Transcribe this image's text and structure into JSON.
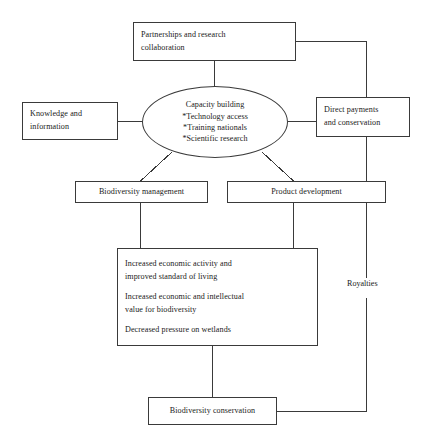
{
  "diagram": {
    "canvas": {
      "width": 432,
      "height": 447
    },
    "style": {
      "stroke_color": "#3a3a3a",
      "text_color": "#1a1a1a",
      "background": "#ffffff"
    },
    "nodes": {
      "partnerships": {
        "shape": "rectangle",
        "line1": "Partnerships and research",
        "line2": "collaboration"
      },
      "knowledge": {
        "shape": "rectangle",
        "line1": "Knowledge and",
        "line2": "information"
      },
      "capacity": {
        "shape": "ellipse",
        "line1": "Capacity building",
        "line2": "*Technology access",
        "line3": "*Training nationals",
        "line4": "*Scientific research"
      },
      "direct_payments": {
        "shape": "rectangle",
        "line1": "Direct payments",
        "line2": "and conservation"
      },
      "biodiversity_management": {
        "shape": "rectangle",
        "label": "Biodiversity management"
      },
      "product_development": {
        "shape": "rectangle",
        "label": "Product development"
      },
      "outcomes": {
        "shape": "rectangle",
        "para1_line1": "Increased economic activity and",
        "para1_line2": "improved standard of living",
        "para2_line1": "Increased economic and intellectual",
        "para2_line2": "value for biodiversity",
        "para3_line1": "Decreased pressure on wetlands"
      },
      "royalties": {
        "shape": "text-label",
        "label": "Royalties"
      },
      "biodiversity_conservation": {
        "shape": "rectangle",
        "label": "Biodiversity conservation"
      }
    }
  }
}
